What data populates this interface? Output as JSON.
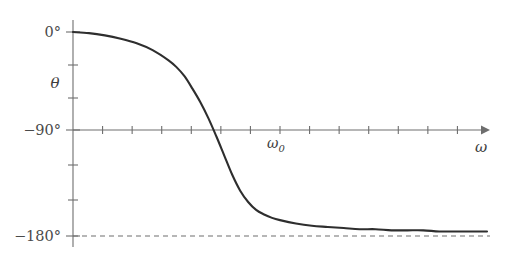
{
  "chart_data": {
    "type": "line",
    "title": "",
    "subtitle": "",
    "xlabel": "ω",
    "ylabel": "θ",
    "xlim": [
      0,
      2.6
    ],
    "ylim": [
      -180,
      0
    ],
    "grid": false,
    "legend": null,
    "y_ticks_major": [
      {
        "value": 0,
        "label": "0°"
      },
      {
        "value": -90,
        "label": "−90°"
      },
      {
        "value": -180,
        "label": "−180°"
      }
    ],
    "y_ticks_minor": [
      -30,
      -60,
      -120,
      -150
    ],
    "x_ticks_minor_count": 13,
    "x_tick_labels": [],
    "annotations": [
      {
        "name": "resonance-frequency",
        "text": "ω",
        "subscript": "0",
        "x": 1.0,
        "y": -90
      }
    ],
    "asymptotes": [
      {
        "name": "phase-lower-asymptote",
        "value": -180,
        "style": "dashed",
        "label": "−180°"
      }
    ],
    "series": [
      {
        "name": "phase-response",
        "description": "Phase of driven damped oscillator versus drive frequency",
        "x": [
          0.0,
          0.1,
          0.2,
          0.3,
          0.4,
          0.5,
          0.6,
          0.65,
          0.7,
          0.75,
          0.8,
          0.85,
          0.9,
          0.95,
          1.0,
          1.05,
          1.1,
          1.15,
          1.2,
          1.25,
          1.3,
          1.4,
          1.5,
          1.6,
          1.7,
          1.8,
          1.9,
          2.0,
          2.1,
          2.2,
          2.3,
          2.4,
          2.5,
          2.6
        ],
        "y": [
          0,
          -1,
          -3,
          -6,
          -10,
          -16,
          -25,
          -31,
          -39,
          -50,
          -62,
          -76,
          -92,
          -109,
          -126,
          -140,
          -150,
          -157,
          -161,
          -164,
          -166,
          -169,
          -171,
          -172,
          -173,
          -174,
          -174,
          -175,
          -175,
          -175,
          -176,
          -176,
          -176,
          -176
        ]
      }
    ]
  },
  "geometry": {
    "origin_x": 73,
    "axis_top_y": 20,
    "axis_bottom_y": 247,
    "y0_y": 32,
    "y90_y": 130,
    "y180_y": 236,
    "x_axis_end": 487,
    "omega0_x": 288,
    "curve_end_x": 487
  },
  "colors": {
    "background": "#ffffff",
    "axis": "#6e6e6e",
    "curve": "#2e2e2e",
    "text": "#3d3d3d",
    "asymptote": "#6e6e6e"
  }
}
